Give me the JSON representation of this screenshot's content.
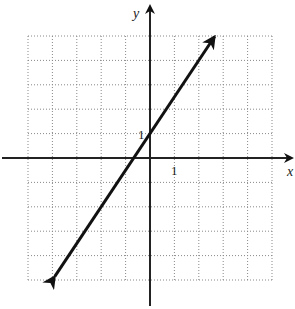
{
  "chart_data": {
    "type": "line",
    "title": "",
    "xlabel": "x",
    "ylabel": "y",
    "xlim": [
      -5,
      5
    ],
    "ylim": [
      -5,
      5
    ],
    "grid": true,
    "tick_labels": {
      "x": [
        "1"
      ],
      "y": [
        "1"
      ]
    },
    "series": [
      {
        "name": "line",
        "equation": "y = 1.5x + 1",
        "x": [
          -3.9,
          2.65
        ],
        "y": [
          -4.85,
          4.98
        ],
        "arrows": "both"
      }
    ]
  },
  "labels": {
    "x_axis": "x",
    "y_axis": "y",
    "x_tick": "1",
    "y_tick": "1"
  }
}
